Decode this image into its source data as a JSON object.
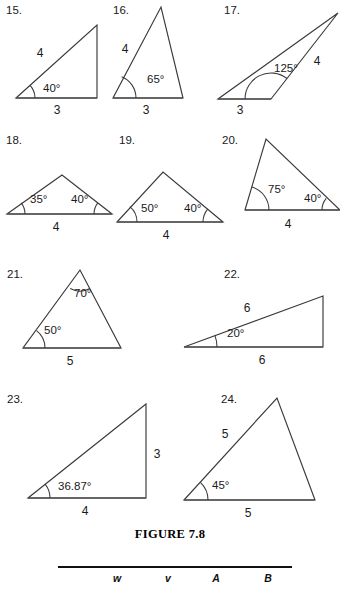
{
  "figure": {
    "caption": "FIGURE 7.8",
    "caption_x": 170,
    "caption_y": 538
  },
  "table_header": {
    "rule": {
      "x1": 58,
      "x2": 292,
      "y": 567
    },
    "columns": [
      {
        "label": "w",
        "x": 117,
        "y": 582
      },
      {
        "label": "v",
        "x": 168,
        "y": 582
      },
      {
        "label": "A",
        "x": 216,
        "y": 582
      },
      {
        "label": "B",
        "x": 268,
        "y": 582
      }
    ]
  },
  "problems": [
    {
      "number": "15.",
      "number_x": 6,
      "number_y": 14,
      "vertices": [
        [
          16,
          98
        ],
        [
          97,
          98
        ],
        [
          97,
          25
        ]
      ],
      "base": [
        [
          16,
          98
        ],
        [
          97,
          98
        ]
      ],
      "side_labels": [
        {
          "text": "4",
          "x": 40,
          "y": 57
        },
        {
          "text": "3",
          "x": 57,
          "y": 114
        }
      ],
      "angle_labels": [
        {
          "text": "40°",
          "x": 43,
          "y": 92
        }
      ],
      "arcs": [
        {
          "cx": 16,
          "cy": 98,
          "r": 19,
          "a_start": -42,
          "a_end": 0
        }
      ]
    },
    {
      "number": "16.",
      "number_x": 113,
      "number_y": 14,
      "vertices": [
        [
          113,
          98
        ],
        [
          183,
          98
        ],
        [
          161,
          7
        ]
      ],
      "base": [
        [
          113,
          98
        ],
        [
          183,
          98
        ]
      ],
      "side_labels": [
        {
          "text": "4",
          "x": 125,
          "y": 53
        },
        {
          "text": "3",
          "x": 146,
          "y": 114
        }
      ],
      "angle_labels": [
        {
          "text": "65°",
          "x": 147,
          "y": 83
        }
      ],
      "arcs": [
        {
          "cx": 113,
          "cy": 98,
          "r": 23,
          "a_start": -68,
          "a_end": 0
        }
      ]
    },
    {
      "number": "17.",
      "number_x": 224,
      "number_y": 14,
      "vertices": [
        [
          218,
          99
        ],
        [
          271,
          99
        ],
        [
          338,
          13
        ]
      ],
      "base": [
        [
          218,
          99
        ],
        [
          271,
          99
        ]
      ],
      "side_labels": [
        {
          "text": "4",
          "x": 317,
          "y": 65
        },
        {
          "text": "3",
          "x": 240,
          "y": 114
        }
      ],
      "angle_labels": [
        {
          "text": "125°",
          "x": 274,
          "y": 72
        }
      ],
      "arcs": [
        {
          "cx": 271,
          "cy": 99,
          "r": 26,
          "a_start": 180,
          "a_end": 308
        }
      ]
    },
    {
      "number": "18.",
      "number_x": 6,
      "number_y": 144,
      "vertices": [
        [
          7,
          214
        ],
        [
          112,
          214
        ],
        [
          62,
          175
        ]
      ],
      "base": [
        [
          7,
          214
        ],
        [
          112,
          214
        ]
      ],
      "side_labels": [
        {
          "text": "4",
          "x": 56,
          "y": 231
        }
      ],
      "angle_labels": [
        {
          "text": "35°",
          "x": 30,
          "y": 203
        },
        {
          "text": "40°",
          "x": 71,
          "y": 203
        }
      ],
      "arcs": [
        {
          "cx": 7,
          "cy": 214,
          "r": 18,
          "a_start": -38,
          "a_end": 0
        },
        {
          "cx": 112,
          "cy": 214,
          "r": 18,
          "a_start": 180,
          "a_end": 218
        }
      ]
    },
    {
      "number": "19.",
      "number_x": 119,
      "number_y": 144,
      "vertices": [
        [
          117,
          222
        ],
        [
          223,
          222
        ],
        [
          163,
          172
        ]
      ],
      "base": [
        [
          117,
          222
        ],
        [
          223,
          222
        ]
      ],
      "side_labels": [
        {
          "text": "4",
          "x": 166,
          "y": 239
        }
      ],
      "angle_labels": [
        {
          "text": "50°",
          "x": 141,
          "y": 212
        },
        {
          "text": "40°",
          "x": 184,
          "y": 212
        }
      ],
      "arcs": [
        {
          "cx": 117,
          "cy": 222,
          "r": 20,
          "a_start": -50,
          "a_end": 0
        },
        {
          "cx": 223,
          "cy": 222,
          "r": 20,
          "a_start": 180,
          "a_end": 220
        }
      ]
    },
    {
      "number": "20.",
      "number_x": 222,
      "number_y": 144,
      "vertices": [
        [
          245,
          210
        ],
        [
          266,
          139
        ],
        [
          340,
          210
        ]
      ],
      "base": [
        [
          245,
          210
        ],
        [
          340,
          210
        ]
      ],
      "side_labels": [
        {
          "text": "4",
          "x": 288,
          "y": 228
        }
      ],
      "angle_labels": [
        {
          "text": "75°",
          "x": 268,
          "y": 193
        },
        {
          "text": "40°",
          "x": 304,
          "y": 202
        }
      ],
      "arcs": [
        {
          "cx": 245,
          "cy": 210,
          "r": 24,
          "a_start": -73,
          "a_end": 0
        },
        {
          "cx": 340,
          "cy": 210,
          "r": 18,
          "a_start": 180,
          "a_end": 220
        }
      ]
    },
    {
      "number": "21.",
      "number_x": 7,
      "number_y": 278,
      "vertices": [
        [
          23,
          348
        ],
        [
          121,
          348
        ],
        [
          80,
          270
        ]
      ],
      "base": [
        [
          23,
          348
        ],
        [
          121,
          348
        ]
      ],
      "side_labels": [
        {
          "text": "5",
          "x": 70,
          "y": 365
        }
      ],
      "angle_labels": [
        {
          "text": "50°",
          "x": 44,
          "y": 334
        },
        {
          "text": "70°",
          "x": 74,
          "y": 297
        }
      ],
      "arcs": [
        {
          "cx": 23,
          "cy": 348,
          "r": 22,
          "a_start": -52,
          "a_end": 0
        },
        {
          "cx": 80,
          "cy": 270,
          "r": 21,
          "a_start": 62,
          "a_end": 118
        }
      ]
    },
    {
      "number": "22.",
      "number_x": 224,
      "number_y": 278,
      "vertices": [
        [
          184,
          347
        ],
        [
          323,
          347
        ],
        [
          323,
          296
        ]
      ],
      "base": [
        [
          184,
          347
        ],
        [
          323,
          347
        ]
      ],
      "side_labels": [
        {
          "text": "6",
          "x": 247,
          "y": 312
        },
        {
          "text": "6",
          "x": 262,
          "y": 364
        }
      ],
      "angle_labels": [
        {
          "text": "20°",
          "x": 227,
          "y": 337
        }
      ],
      "arcs": [
        {
          "cx": 184,
          "cy": 347,
          "r": 33,
          "a_start": -21,
          "a_end": 0
        }
      ]
    },
    {
      "number": "23.",
      "number_x": 7,
      "number_y": 403,
      "vertices": [
        [
          28,
          498
        ],
        [
          146,
          498
        ],
        [
          146,
          404
        ]
      ],
      "base": [
        [
          28,
          498
        ],
        [
          146,
          498
        ]
      ],
      "side_labels": [
        {
          "text": "3",
          "x": 157,
          "y": 458
        },
        {
          "text": "4",
          "x": 85,
          "y": 515
        }
      ],
      "angle_labels": [
        {
          "text": "36.87°",
          "x": 58,
          "y": 490
        }
      ],
      "arcs": [
        {
          "cx": 28,
          "cy": 498,
          "r": 22,
          "a_start": -39,
          "a_end": 0
        }
      ]
    },
    {
      "number": "24.",
      "number_x": 221,
      "number_y": 403,
      "vertices": [
        [
          184,
          500
        ],
        [
          315,
          500
        ],
        [
          277,
          398
        ]
      ],
      "base": [
        [
          184,
          500
        ],
        [
          315,
          500
        ]
      ],
      "side_labels": [
        {
          "text": "5",
          "x": 225,
          "y": 438
        },
        {
          "text": "5",
          "x": 248,
          "y": 517
        }
      ],
      "angle_labels": [
        {
          "text": "45°",
          "x": 212,
          "y": 489
        }
      ],
      "arcs": [
        {
          "cx": 184,
          "cy": 500,
          "r": 24,
          "a_start": -47,
          "a_end": 0
        }
      ]
    }
  ]
}
